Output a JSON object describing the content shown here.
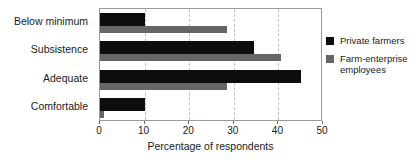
{
  "chart_data": {
    "type": "bar",
    "orientation": "horizontal",
    "title": "",
    "subtitle": "",
    "xlabel": "Percentage of respondents",
    "ylabel": "",
    "xlim": [
      0,
      50
    ],
    "xticks": [
      0,
      10,
      20,
      30,
      40,
      50
    ],
    "xtick_labels": [
      "0",
      "10",
      "20",
      "30",
      "40",
      "50"
    ],
    "grid": true,
    "grid_axis": "x",
    "grid_style": "dashed",
    "legend_position": "right",
    "categories": [
      "Below minimum",
      "Subsistence",
      "Adequate",
      "Comfortable"
    ],
    "series": [
      {
        "name": "Private farmers",
        "color": "#0d0d0d",
        "values": [
          10,
          34.5,
          45,
          10
        ]
      },
      {
        "name": "Farm-enterprise employees",
        "color": "#666666",
        "values": [
          28.5,
          40.5,
          28.5,
          1
        ]
      }
    ]
  },
  "legend": {
    "items": [
      {
        "label": "Private farmers",
        "color": "#0d0d0d"
      },
      {
        "label": "Farm-enterprise employees",
        "color": "#666666"
      }
    ]
  },
  "colors": {
    "series_private_farmers": "#0d0d0d",
    "series_farm_enterprise": "#666666",
    "frame": "#9a9a9a",
    "gridline": "#c2c2c2",
    "text": "#1a1a1a",
    "background": "#ffffff"
  }
}
